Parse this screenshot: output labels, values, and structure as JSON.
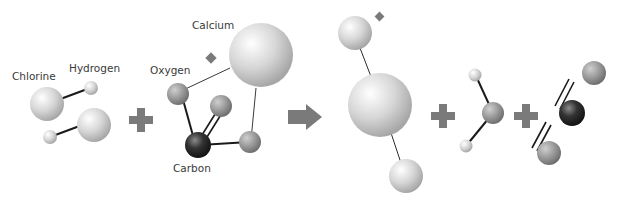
{
  "diagram": {
    "type": "chemical-reaction",
    "labels": {
      "chlorine": "Chlorine",
      "hydrogen": "Hydrogen",
      "oxygen": "Oxygen",
      "calcium": "Calcium",
      "carbon": "Carbon"
    },
    "operators": {
      "plus": "+",
      "arrow": "→"
    },
    "reactants": [
      {
        "name": "hydrogen-chloride",
        "count": 2
      },
      {
        "name": "calcium-carbonate",
        "count": 1
      }
    ],
    "products": [
      {
        "name": "calcium-chloride"
      },
      {
        "name": "water"
      },
      {
        "name": "carbon-dioxide"
      }
    ],
    "colors": {
      "light_atom": "#d8d8d8",
      "mid_atom": "#9a9a9a",
      "carbon_atom": "#2a2a2a",
      "operator": "#7a7a7a",
      "bond": "#1a1a1a"
    }
  }
}
